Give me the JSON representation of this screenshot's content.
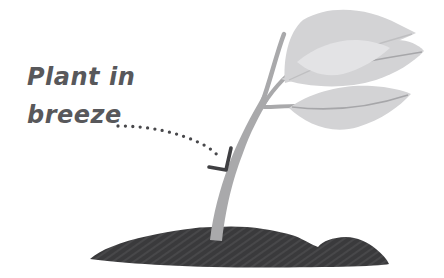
{
  "annotation": {
    "label_line1": "Plant in",
    "label_line2": "breeze",
    "text_color": "#58585b",
    "arrow_style": "dotted-curve",
    "arrow_color": "#48484b",
    "arrowhead_color": "#3f3f42"
  },
  "plant": {
    "leaf_color": "#d3d3d5",
    "leaf_highlight_color": "#e3e3e5",
    "vein_color": "#a6a6a9",
    "stem_color": "#a9a9ab",
    "soil_color": "#3a3a3c",
    "soil_hatch_color": "#535355"
  },
  "canvas": {
    "background_color": "#ffffff",
    "width": 444,
    "height": 278
  }
}
